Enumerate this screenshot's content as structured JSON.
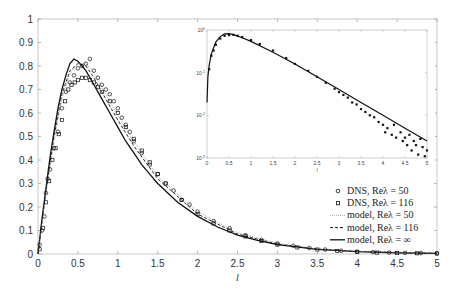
{
  "chart_data": [
    {
      "type": "line",
      "role": "main",
      "title": "",
      "xlabel": "l",
      "ylabel": "",
      "xlim": [
        0,
        5
      ],
      "ylim": [
        0,
        1
      ],
      "xticks": [
        "0",
        "0.5",
        "1",
        "1.5",
        "2",
        "2.5",
        "3",
        "3.5",
        "4",
        "4.5",
        "5"
      ],
      "yticks": [
        "0",
        "0.1",
        "0.2",
        "0.3",
        "0.4",
        "0.5",
        "0.6",
        "0.7",
        "0.8",
        "0.9",
        "1"
      ],
      "grid": false,
      "legend_position": "lower right",
      "legend": [
        {
          "label": "DNS, Re_λ = 50",
          "text": "DNS, Reλ = 50",
          "style": "circle-marker"
        },
        {
          "label": "DNS, Re_λ = 116",
          "text": "DNS, Reλ = 116",
          "style": "square-marker"
        },
        {
          "label": "model, Re_λ = 50",
          "text": "model, Reλ = 50",
          "style": "dotted-line"
        },
        {
          "label": "model, Re_λ = 116",
          "text": "model, Reλ = 116",
          "style": "dashed-line"
        },
        {
          "label": "model, Re_λ = ∞",
          "text": "model, Reλ = ∞",
          "style": "solid-line"
        }
      ],
      "series": [
        {
          "name": "model, Re_λ = ∞",
          "style": "solid",
          "x": [
            0,
            0.05,
            0.1,
            0.15,
            0.2,
            0.25,
            0.3,
            0.35,
            0.4,
            0.45,
            0.5,
            0.6,
            0.7,
            0.8,
            0.9,
            1.0,
            1.1,
            1.2,
            1.3,
            1.4,
            1.5,
            1.75,
            2.0,
            2.25,
            2.5,
            2.75,
            3.0,
            3.5,
            4.0,
            4.5,
            5.0
          ],
          "y": [
            0,
            0.15,
            0.28,
            0.41,
            0.52,
            0.62,
            0.7,
            0.76,
            0.81,
            0.83,
            0.82,
            0.78,
            0.72,
            0.66,
            0.6,
            0.54,
            0.48,
            0.43,
            0.38,
            0.34,
            0.3,
            0.22,
            0.16,
            0.115,
            0.08,
            0.058,
            0.04,
            0.02,
            0.01,
            0.005,
            0.0025
          ]
        },
        {
          "name": "model, Re_λ = 116",
          "style": "dashed",
          "x": [
            0,
            0.1,
            0.2,
            0.3,
            0.4,
            0.5,
            0.6,
            0.7,
            0.8,
            1.0,
            1.2,
            1.5,
            2.0,
            2.5,
            3.0,
            3.5,
            4.0,
            5.0
          ],
          "y": [
            0,
            0.27,
            0.5,
            0.68,
            0.78,
            0.81,
            0.8,
            0.75,
            0.69,
            0.57,
            0.46,
            0.32,
            0.17,
            0.085,
            0.042,
            0.021,
            0.011,
            0.003
          ]
        },
        {
          "name": "model, Re_λ = 50",
          "style": "dotted",
          "x": [
            0,
            0.1,
            0.2,
            0.3,
            0.4,
            0.5,
            0.6,
            0.7,
            0.8,
            1.0,
            1.2,
            1.5,
            2.0,
            2.5,
            3.0,
            3.5,
            4.0,
            5.0
          ],
          "y": [
            0,
            0.26,
            0.48,
            0.66,
            0.77,
            0.81,
            0.81,
            0.77,
            0.71,
            0.59,
            0.48,
            0.33,
            0.18,
            0.09,
            0.045,
            0.022,
            0.011,
            0.003
          ]
        },
        {
          "name": "DNS, Re_λ = 50",
          "style": "circle",
          "x": [
            0.02,
            0.05,
            0.08,
            0.1,
            0.12,
            0.15,
            0.2,
            0.25,
            0.3,
            0.35,
            0.4,
            0.45,
            0.5,
            0.55,
            0.6,
            0.65,
            0.7,
            0.75,
            0.8,
            0.85,
            0.9,
            0.95,
            1.0,
            1.05,
            1.1,
            1.15,
            1.2,
            1.3,
            1.4,
            1.5,
            1.6,
            1.7,
            1.8,
            1.9,
            2.0,
            2.2,
            2.4,
            2.6,
            2.8,
            3.0,
            3.2,
            3.4,
            3.6,
            3.8,
            4.0,
            4.2,
            4.4,
            4.6,
            4.8,
            5.0
          ],
          "y": [
            0.04,
            0.1,
            0.16,
            0.26,
            0.32,
            0.36,
            0.45,
            0.52,
            0.62,
            0.69,
            0.73,
            0.76,
            0.79,
            0.8,
            0.81,
            0.83,
            0.78,
            0.75,
            0.72,
            0.7,
            0.68,
            0.65,
            0.62,
            0.58,
            0.55,
            0.52,
            0.48,
            0.43,
            0.38,
            0.34,
            0.3,
            0.27,
            0.23,
            0.21,
            0.18,
            0.14,
            0.11,
            0.08,
            0.06,
            0.045,
            0.035,
            0.026,
            0.019,
            0.014,
            0.01,
            0.008,
            0.006,
            0.005,
            0.004,
            0.003
          ]
        },
        {
          "name": "DNS, Re_λ = 116",
          "style": "square",
          "x": [
            0.02,
            0.06,
            0.1,
            0.14,
            0.18,
            0.22,
            0.26,
            0.3,
            0.34,
            0.38,
            0.42,
            0.46,
            0.5,
            0.55,
            0.6,
            0.65,
            0.7,
            0.75,
            0.8,
            0.9,
            1.0,
            1.1,
            1.2,
            1.3,
            1.4,
            1.5,
            1.6,
            1.8,
            2.0,
            2.2,
            2.4,
            2.6,
            2.8,
            3.0,
            3.25,
            3.5,
            3.75,
            4.0,
            4.25,
            4.5,
            4.75,
            5.0
          ],
          "y": [
            0.02,
            0.11,
            0.22,
            0.31,
            0.4,
            0.45,
            0.51,
            0.57,
            0.65,
            0.7,
            0.72,
            0.73,
            0.74,
            0.75,
            0.75,
            0.74,
            0.73,
            0.71,
            0.69,
            0.65,
            0.6,
            0.54,
            0.49,
            0.44,
            0.39,
            0.34,
            0.3,
            0.23,
            0.17,
            0.13,
            0.1,
            0.075,
            0.055,
            0.04,
            0.028,
            0.019,
            0.013,
            0.009,
            0.006,
            0.004,
            0.003,
            0.002
          ]
        }
      ]
    },
    {
      "type": "line",
      "role": "inset",
      "title": "",
      "xlabel": "l",
      "ylabel": "",
      "yscale": "log",
      "xlim": [
        0,
        5
      ],
      "ylim": [
        0.001,
        1
      ],
      "xticks": [
        "0",
        "0.5",
        "1",
        "1.5",
        "2",
        "2.5",
        "3",
        "3.5",
        "4",
        "4.5",
        "5"
      ],
      "yticks": [
        "10^-3",
        "10^-2",
        "10^-1",
        "10^0"
      ],
      "grid": false,
      "series": [
        {
          "name": "model (solid)",
          "style": "solid",
          "x": [
            0,
            0.02,
            0.05,
            0.1,
            0.2,
            0.3,
            0.4,
            0.5,
            0.6,
            0.7,
            0.8,
            1.0,
            1.5,
            2.0,
            2.5,
            3.0,
            3.5,
            4.0,
            4.5,
            5.0
          ],
          "y": [
            0.02,
            0.08,
            0.15,
            0.28,
            0.52,
            0.7,
            0.81,
            0.82,
            0.78,
            0.72,
            0.66,
            0.54,
            0.3,
            0.16,
            0.08,
            0.04,
            0.02,
            0.01,
            0.005,
            0.0025
          ]
        },
        {
          "name": "DNS scatter",
          "style": "square",
          "x": [
            0.05,
            0.1,
            0.15,
            0.2,
            0.3,
            0.4,
            0.5,
            0.6,
            0.7,
            0.8,
            1.0,
            1.2,
            1.5,
            1.8,
            2.0,
            2.3,
            2.5,
            2.7,
            2.9,
            3.0,
            3.1,
            3.2,
            3.3,
            3.4,
            3.5,
            3.6,
            3.7,
            3.8,
            3.9,
            4.0,
            4.05,
            4.1,
            4.2,
            4.25,
            4.3,
            4.4,
            4.45,
            4.5,
            4.55,
            4.6,
            4.65,
            4.7,
            4.75,
            4.8,
            4.85,
            4.9,
            4.95,
            5.0
          ],
          "y": [
            0.12,
            0.25,
            0.33,
            0.45,
            0.63,
            0.73,
            0.76,
            0.77,
            0.73,
            0.68,
            0.58,
            0.47,
            0.33,
            0.22,
            0.16,
            0.11,
            0.08,
            0.058,
            0.042,
            0.035,
            0.03,
            0.026,
            0.02,
            0.018,
            0.014,
            0.012,
            0.01,
            0.009,
            0.007,
            0.006,
            0.004,
            0.005,
            0.0035,
            0.006,
            0.003,
            0.004,
            0.0025,
            0.003,
            0.002,
            0.0035,
            0.0015,
            0.0025,
            0.002,
            0.0012,
            0.0028,
            0.0018,
            0.0011,
            0.0015
          ]
        }
      ]
    }
  ]
}
